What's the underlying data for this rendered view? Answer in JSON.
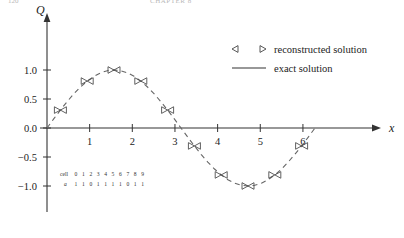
{
  "header": {
    "page_number": "120",
    "running_title": "CHAPTER 8"
  },
  "chart_data": {
    "type": "line",
    "title": "",
    "xlabel": "x",
    "ylabel": "Q",
    "xlim": [
      -0.35,
      6.9
    ],
    "ylim": [
      -1.35,
      1.35
    ],
    "grid": false,
    "xticks": [
      1,
      2,
      3,
      4,
      5,
      6
    ],
    "xtick_labels": [
      "1",
      "2",
      "3",
      "4",
      "5",
      "6"
    ],
    "yticks": [
      1.0,
      0.5,
      0.0,
      -0.5,
      -1.0
    ],
    "ytick_labels": [
      "1.0",
      "0.5",
      "0.0",
      "−0.5",
      "−1.0"
    ],
    "legend_position": "upper right",
    "series": [
      {
        "name": "exact solution",
        "type": "line",
        "style": "dashed",
        "color": "#555555",
        "function": "sin(x)",
        "x": [
          0.0,
          0.157,
          0.314,
          0.471,
          0.628,
          0.785,
          0.942,
          1.1,
          1.257,
          1.414,
          1.571,
          1.728,
          1.885,
          2.042,
          2.199,
          2.356,
          2.513,
          2.67,
          2.827,
          2.985,
          3.142,
          3.299,
          3.456,
          3.613,
          3.77,
          3.927,
          4.084,
          4.241,
          4.398,
          4.555,
          4.712,
          4.869,
          5.027,
          5.184,
          5.341,
          5.498,
          5.655,
          5.812,
          5.969,
          6.126,
          6.283
        ],
        "y": [
          0.0,
          0.156,
          0.309,
          0.454,
          0.588,
          0.707,
          0.809,
          0.891,
          0.951,
          0.988,
          1.0,
          0.988,
          0.951,
          0.891,
          0.809,
          0.707,
          0.588,
          0.454,
          0.309,
          0.156,
          0.0,
          -0.156,
          -0.309,
          -0.454,
          -0.588,
          -0.707,
          -0.809,
          -0.891,
          -0.951,
          -0.988,
          -1.0,
          -0.988,
          -0.951,
          -0.891,
          -0.809,
          -0.707,
          -0.588,
          -0.454,
          -0.309,
          -0.156,
          0.0
        ]
      },
      {
        "name": "reconstructed solution",
        "type": "markers",
        "marker_left": "◁",
        "marker_right": "▷",
        "color": "#444444",
        "points": [
          {
            "cell": 0,
            "x_left": 0.0,
            "x_right": 0.628,
            "y_left": 0.0,
            "y_right": 0.588
          },
          {
            "cell": 1,
            "x_left": 0.628,
            "x_right": 1.257,
            "y_left": 0.588,
            "y_right": 0.951
          },
          {
            "cell": 2,
            "x_left": 1.257,
            "x_right": 1.885,
            "y_left": 0.951,
            "y_right": 0.951
          },
          {
            "cell": 3,
            "x_left": 1.885,
            "x_right": 2.513,
            "y_left": 0.951,
            "y_right": 0.588
          },
          {
            "cell": 4,
            "x_left": 2.513,
            "x_right": 3.142,
            "y_left": 0.588,
            "y_right": 0.0
          },
          {
            "cell": 5,
            "x_left": 3.142,
            "x_right": 3.77,
            "y_left": 0.0,
            "y_right": -0.588
          },
          {
            "cell": 6,
            "x_left": 3.77,
            "x_right": 4.398,
            "y_left": -0.588,
            "y_right": -0.951
          },
          {
            "cell": 7,
            "x_left": 4.398,
            "x_right": 5.027,
            "y_left": -0.951,
            "y_right": -0.951
          },
          {
            "cell": 8,
            "x_left": 5.027,
            "x_right": 5.655,
            "y_left": -0.951,
            "y_right": -0.588
          },
          {
            "cell": 9,
            "x_left": 5.655,
            "x_right": 6.283,
            "y_left": -0.588,
            "y_right": 0.0
          }
        ]
      }
    ],
    "annotation_table": {
      "row_labels": [
        "cell",
        "a"
      ],
      "cells": [
        "0",
        "1",
        "2",
        "3",
        "4",
        "5",
        "6",
        "7",
        "8",
        "9"
      ],
      "a_values": [
        "1",
        "1",
        "0",
        "1",
        "1",
        "1",
        "1",
        "0",
        "1",
        "1"
      ]
    }
  },
  "legend": {
    "items": [
      {
        "label": "reconstructed solution",
        "marker_left": "◁",
        "marker_right": "▷",
        "sample": "markers"
      },
      {
        "label": "exact solution",
        "sample": "line"
      }
    ]
  }
}
